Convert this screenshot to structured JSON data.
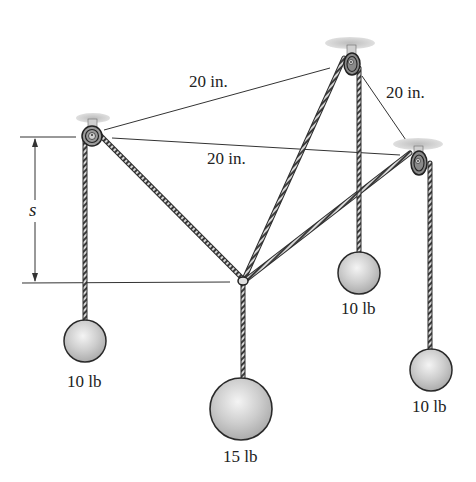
{
  "diagram": {
    "type": "statics-pulley-system",
    "labels": {
      "dim_ab": "20 in.",
      "dim_bc": "20 in.",
      "dim_ac": "20 in.",
      "dim_s": "s",
      "weight_a": "10 lb",
      "weight_b": "10 lb",
      "weight_c": "10 lb",
      "weight_center": "15 lb"
    },
    "colors": {
      "rope": "#555555",
      "rope_dark": "#2a2a2a",
      "dim_line": "#333333",
      "sphere_fill": "#cfcfcf",
      "sphere_highlight": "#f2f2f2",
      "sphere_outline": "#333333",
      "mount": "#c9c9c9"
    },
    "pulleys": [
      {
        "id": "A",
        "x": 92,
        "y": 135
      },
      {
        "id": "B",
        "x": 352,
        "y": 62
      },
      {
        "id": "C",
        "x": 416,
        "y": 160
      }
    ],
    "knot": {
      "x": 243,
      "y": 280
    }
  }
}
